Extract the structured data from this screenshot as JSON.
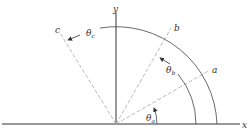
{
  "diagram": {
    "axes": {
      "x_label": "x",
      "y_label": "y"
    },
    "lines": [
      {
        "label": "a",
        "angle_deg": 30
      },
      {
        "label": "b",
        "angle_deg": 60
      },
      {
        "label": "c",
        "angle_deg": 122
      }
    ],
    "angles": [
      {
        "symbol": "θ",
        "sub": "a"
      },
      {
        "symbol": "θ",
        "sub": "b"
      },
      {
        "symbol": "θ",
        "sub": "c"
      }
    ],
    "colors": {
      "axis": "#333333",
      "dashed": "#aaaaaa",
      "arc": "#444444"
    }
  }
}
